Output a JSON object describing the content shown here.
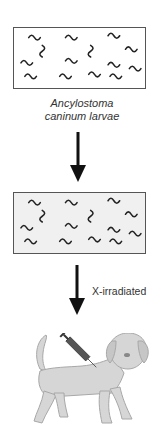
{
  "figure": {
    "larvae_box_1": {
      "description": "larvae culture",
      "larva_count": 14
    },
    "larvae_label": {
      "line1": "Ancylostoma",
      "line2": "caninum larvae"
    },
    "larvae_box_2": {
      "description": "larvae culture (processed)",
      "larva_count": 14
    },
    "step_label": "X-irradiated",
    "final_subject": "dog receiving injection",
    "colors": {
      "outline": "#555555",
      "larva": "#222222",
      "box2_fill": "#f0f0f0",
      "arrow": "#111111",
      "dog_fill": "#d4d4d4",
      "dog_outline": "#a8a8a8"
    }
  }
}
